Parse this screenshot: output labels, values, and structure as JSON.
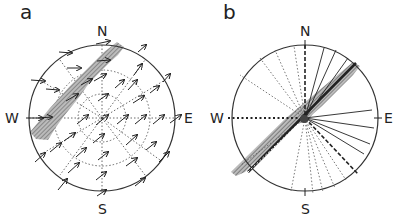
{
  "figure": {
    "panels": [
      {
        "id": "a",
        "label": "a",
        "type": "vector-field-stereonet",
        "compass": {
          "north": "N",
          "south": "S",
          "east": "E",
          "west": "W"
        },
        "grid": {
          "rings": 3,
          "style": "dotted"
        },
        "arrow_direction": "toward NE (upper right)",
        "band": {
          "style": "hatched",
          "orientation": "NE-SW",
          "position": "northwest of center"
        }
      },
      {
        "id": "b",
        "label": "b",
        "type": "radial-line-stereonet",
        "compass": {
          "north": "N",
          "south": "S",
          "east": "E",
          "west": "W"
        },
        "line_styles": [
          "solid",
          "dashed",
          "dotted"
        ],
        "band": {
          "style": "hatched",
          "orientation": "NE-SW",
          "through_center": true
        }
      }
    ],
    "colors": {
      "ink": "#222222",
      "hatch": "#888888",
      "background": "#ffffff"
    }
  }
}
